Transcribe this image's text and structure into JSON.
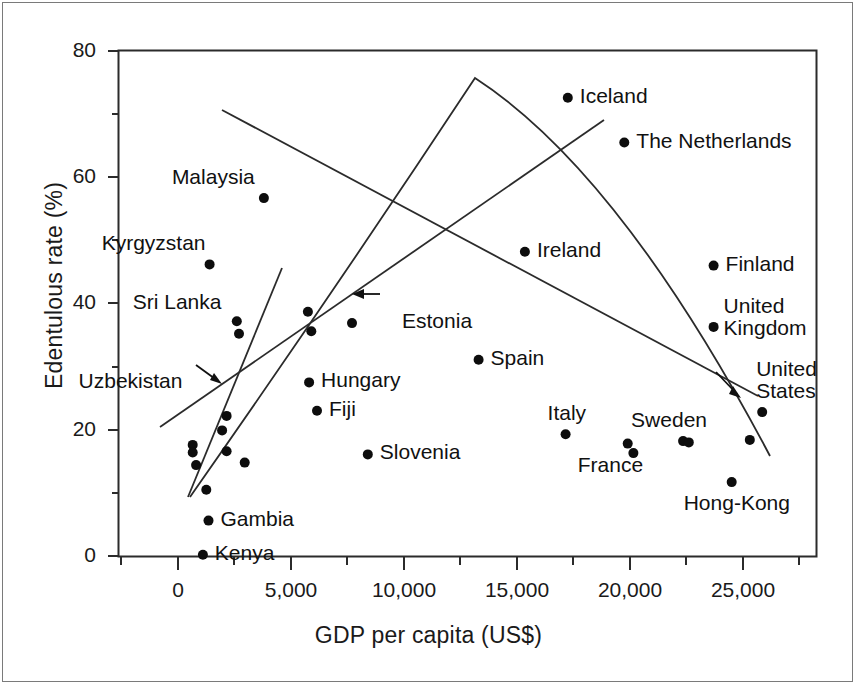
{
  "chart_data": {
    "type": "scatter",
    "title": "",
    "xlabel": "GDP per capita (US$)",
    "ylabel": "Edentulous rate (%)",
    "xlim": [
      -1400,
      28800
    ],
    "ylim": [
      -4,
      80
    ],
    "grid": false,
    "legend": "none",
    "x_ticks": [
      0,
      5000,
      10000,
      15000,
      20000,
      25000
    ],
    "x_tick_labels": [
      "0",
      "5,000",
      "10,000",
      "15,000",
      "20,000",
      "25,000"
    ],
    "x_minor_ticks": [
      -2500,
      2500,
      7500,
      12500,
      17500,
      22500,
      27500
    ],
    "y_ticks": [
      0,
      20,
      40,
      60,
      80
    ],
    "y_tick_labels": [
      "0",
      "20",
      "40",
      "60",
      "80"
    ],
    "y_minor_ticks": [
      10,
      30,
      50,
      70
    ],
    "points": [
      {
        "label": "Kenya",
        "x": 1100,
        "y": 0.2,
        "label_pos": "right"
      },
      {
        "label": "Gambia",
        "x": 1350,
        "y": 5.6,
        "label_pos": "right"
      },
      {
        "label": "",
        "x": 1250,
        "y": 10.5,
        "label_pos": "none"
      },
      {
        "label": "",
        "x": 650,
        "y": 17.6,
        "label_pos": "none"
      },
      {
        "label": "",
        "x": 650,
        "y": 16.4,
        "label_pos": "none"
      },
      {
        "label": "",
        "x": 800,
        "y": 14.4,
        "label_pos": "none"
      },
      {
        "label": "",
        "x": 2150,
        "y": 16.6,
        "label_pos": "none"
      },
      {
        "label": "",
        "x": 2950,
        "y": 14.8,
        "label_pos": "none"
      },
      {
        "label": "",
        "x": 1950,
        "y": 19.9,
        "label_pos": "none"
      },
      {
        "label": "Uzbekistan",
        "x": 2150,
        "y": 22.2,
        "label_pos": "arrow"
      },
      {
        "label": "Hungary",
        "x": 5800,
        "y": 27.5,
        "label_pos": "right"
      },
      {
        "label": "Fiji",
        "x": 6150,
        "y": 23.0,
        "label_pos": "right"
      },
      {
        "label": "Slovenia",
        "x": 8400,
        "y": 16.1,
        "label_pos": "right"
      },
      {
        "label": "Sri Lanka",
        "x": 2600,
        "y": 37.2,
        "label_pos": "above"
      },
      {
        "label": "",
        "x": 2700,
        "y": 35.2,
        "label_pos": "none"
      },
      {
        "label": "",
        "x": 5750,
        "y": 38.7,
        "label_pos": "none"
      },
      {
        "label": "",
        "x": 5900,
        "y": 35.6,
        "label_pos": "none"
      },
      {
        "label": "Estonia",
        "x": 7700,
        "y": 36.9,
        "label_pos": "arrow"
      },
      {
        "label": "Kyrgyzstan",
        "x": 1400,
        "y": 46.2,
        "label_pos": "above"
      },
      {
        "label": "Malaysia",
        "x": 3800,
        "y": 56.7,
        "label_pos": "above"
      },
      {
        "label": "Iceland",
        "x": 17250,
        "y": 72.6,
        "label_pos": "right"
      },
      {
        "label": "The Netherlands",
        "x": 19750,
        "y": 65.5,
        "label_pos": "right"
      },
      {
        "label": "Ireland",
        "x": 15350,
        "y": 48.2,
        "label_pos": "right"
      },
      {
        "label": "Finland",
        "x": 23700,
        "y": 46.0,
        "label_pos": "right"
      },
      {
        "label": "United Kingdom",
        "x": 23700,
        "y": 36.3,
        "label_pos": "right-two-line"
      },
      {
        "label": "Spain",
        "x": 13300,
        "y": 31.1,
        "label_pos": "right"
      },
      {
        "label": "United States",
        "x": 25850,
        "y": 22.8,
        "label_pos": "above-two-line"
      },
      {
        "label": "Italy",
        "x": 17150,
        "y": 19.3,
        "label_pos": "above"
      },
      {
        "label": "France",
        "x": 19900,
        "y": 17.8,
        "label_pos": "below"
      },
      {
        "label": "",
        "x": 20150,
        "y": 16.3,
        "label_pos": "none"
      },
      {
        "label": "Sweden",
        "x": 22350,
        "y": 18.2,
        "label_pos": "above"
      },
      {
        "label": "",
        "x": 22600,
        "y": 18.0,
        "label_pos": "none"
      },
      {
        "label": "",
        "x": 25300,
        "y": 18.4,
        "label_pos": "arrow"
      },
      {
        "label": "Hong-Kong",
        "x": 24500,
        "y": 11.7,
        "label_pos": "below"
      }
    ],
    "curves": [
      {
        "name": "quadratic-fit",
        "type": "parabola",
        "description": "Inverted U-shaped quadratic fit rising from low GDP, peaking near 13,500 US$ at ~73.5% then declining"
      },
      {
        "name": "positive-regression-line",
        "type": "line",
        "description": "Ascending straight line from low GDP low rate to high GDP high rate"
      },
      {
        "name": "negative-regression-line",
        "type": "line",
        "description": "Descending straight line from low GDP high rate to high GDP low rate"
      }
    ],
    "annotations": [
      {
        "label": "Uzbekistan",
        "type": "arrow-pointer"
      },
      {
        "label": "Estonia",
        "type": "arrow-pointer"
      },
      {
        "label": "United States",
        "type": "arrow-pointer"
      }
    ]
  }
}
